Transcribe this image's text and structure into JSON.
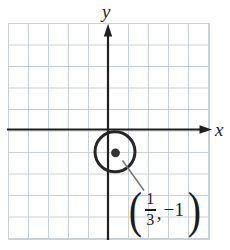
{
  "figure": {
    "axes": {
      "x_label": "x",
      "y_label": "y"
    },
    "grid": {
      "columns": 10,
      "rows": 10,
      "x_range": [
        -5,
        5
      ],
      "y_range": [
        -5,
        5
      ]
    },
    "circle": {
      "center": {
        "x": "1/3",
        "y": "-1"
      },
      "radius_units": 1
    },
    "point_label": {
      "open_paren": "(",
      "numerator": "1",
      "denominator": "3",
      "comma": ",",
      "second_coordinate": "−1",
      "close_paren": ")"
    },
    "colors": {
      "background": "#ffffff",
      "grid_line": "#c9d0d7",
      "axis": "#1f1f1f",
      "circle_stroke": "#262626",
      "point_fill": "#333333",
      "leader_line": "#777777"
    }
  }
}
